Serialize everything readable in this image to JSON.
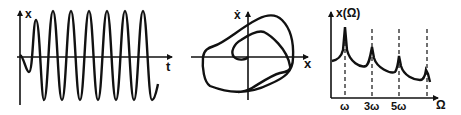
{
  "panels": {
    "time_series": {
      "y_label": "x",
      "x_label": "t"
    },
    "phase_portrait": {
      "y_label": "ẋ",
      "x_label": "x"
    },
    "spectrum": {
      "y_label": "x(Ω)",
      "x_label": "Ω",
      "ticks": [
        "ω",
        "3ω",
        "5ω"
      ]
    }
  },
  "colors": {
    "ink": "#111111",
    "background": "#ffffff"
  }
}
